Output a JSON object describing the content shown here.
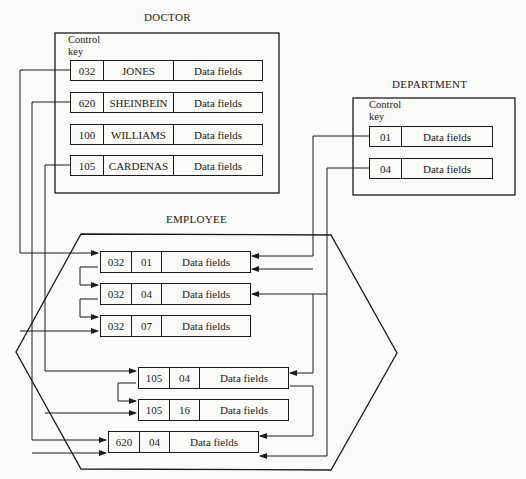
{
  "doctor": {
    "title": "DOCTOR",
    "key_label_1": "Control",
    "key_label_2": "key",
    "records": [
      {
        "key": "032",
        "name": "JONES",
        "data": "Data fields"
      },
      {
        "key": "620",
        "name": "SHEINBEIN",
        "data": "Data fields"
      },
      {
        "key": "100",
        "name": "WILLIAMS",
        "data": "Data fields"
      },
      {
        "key": "105",
        "name": "CARDENAS",
        "data": "Data fields"
      }
    ]
  },
  "department": {
    "title": "DEPARTMENT",
    "key_label_1": "Control",
    "key_label_2": "key",
    "records": [
      {
        "key": "01",
        "data": "Data fields"
      },
      {
        "key": "04",
        "data": "Data fields"
      }
    ]
  },
  "employee": {
    "title": "EMPLOYEE",
    "records": [
      {
        "doctor": "032",
        "dept": "01",
        "data": "Data fields"
      },
      {
        "doctor": "032",
        "dept": "04",
        "data": "Data fields"
      },
      {
        "doctor": "032",
        "dept": "07",
        "data": "Data fields"
      },
      {
        "doctor": "105",
        "dept": "04",
        "data": "Data fields"
      },
      {
        "doctor": "105",
        "dept": "16",
        "data": "Data fields"
      },
      {
        "doctor": "620",
        "dept": "04",
        "data": "Data fields"
      }
    ]
  },
  "colors": {
    "ink": "#1a1a1a",
    "paper": "#fbfbf9"
  }
}
